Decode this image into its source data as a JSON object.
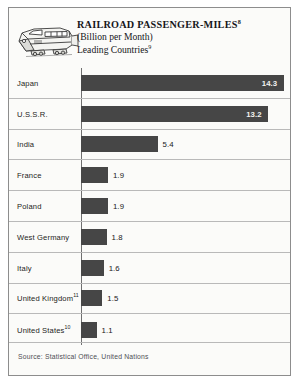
{
  "header": {
    "title": "RAILROAD PASSENGER-MILES",
    "title_ref": "8",
    "subtitle_1": "(Billion per Month)",
    "subtitle_2": "Leading Countries",
    "subtitle_2_ref": "9",
    "illustration": "locomotive-illustration"
  },
  "footer": {
    "source": "Source: Statistical Office, United Nations"
  },
  "colors": {
    "bar": "#464646",
    "paper": "#fbfbf9",
    "frame": "#8d8d8d",
    "rule": "#b9b9b9",
    "value_inside": "#f2f2ef",
    "value_outside": "#18181c"
  },
  "chart_data": {
    "type": "bar",
    "orientation": "horizontal",
    "title": "RAILROAD PASSENGER-MILES",
    "subtitle": "(Billion per Month) Leading Countries",
    "xlabel": "",
    "ylabel": "",
    "xlim": [
      0,
      14.6
    ],
    "grid": false,
    "legend": "none",
    "value_unit": "Billion passenger-miles per month",
    "source": "Source: Statistical Office, United Nations",
    "categories": [
      "Japan",
      "U.S.S.R.",
      "India",
      "France",
      "Poland",
      "West Germany",
      "Italy",
      "United Kingdom",
      "United States"
    ],
    "values": [
      14.3,
      13.2,
      5.4,
      1.9,
      1.9,
      1.8,
      1.6,
      1.5,
      1.1
    ],
    "rows": [
      {
        "label": "Japan",
        "footnote": "",
        "value": 14.3,
        "value_text": "14.3",
        "label_position": "inside"
      },
      {
        "label": "U.S.S.R.",
        "footnote": "",
        "value": 13.2,
        "value_text": "13.2",
        "label_position": "inside"
      },
      {
        "label": "India",
        "footnote": "",
        "value": 5.4,
        "value_text": "5.4",
        "label_position": "outside"
      },
      {
        "label": "France",
        "footnote": "",
        "value": 1.9,
        "value_text": "1.9",
        "label_position": "outside"
      },
      {
        "label": "Poland",
        "footnote": "",
        "value": 1.9,
        "value_text": "1.9",
        "label_position": "outside"
      },
      {
        "label": "West Germany",
        "footnote": "",
        "value": 1.8,
        "value_text": "1.8",
        "label_position": "outside"
      },
      {
        "label": "Italy",
        "footnote": "",
        "value": 1.6,
        "value_text": "1.6",
        "label_position": "outside"
      },
      {
        "label": "United Kingdom",
        "footnote": "11",
        "value": 1.5,
        "value_text": "1.5",
        "label_position": "outside"
      },
      {
        "label": "United States",
        "footnote": "10",
        "value": 1.1,
        "value_text": "1.1",
        "label_position": "outside"
      }
    ]
  }
}
